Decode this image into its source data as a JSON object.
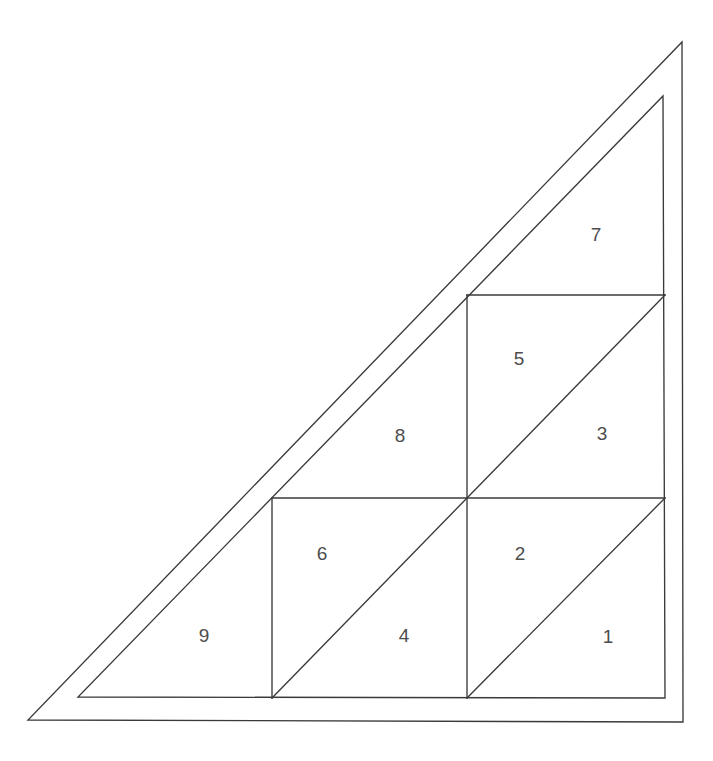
{
  "figure": {
    "type": "geometric-diagram",
    "background_color": "#ffffff",
    "stroke_color": "#3a3a3a",
    "label_color": "#4d4d4d",
    "stroke_width": 1.35
  },
  "outer_triangle": {
    "name": "outer-triangle",
    "vertices": [
      [
        28,
        720
      ],
      [
        683,
        722
      ],
      [
        682,
        42
      ]
    ]
  },
  "inner_triangle": {
    "name": "inner-triangle",
    "vertices": [
      [
        78,
        697
      ],
      [
        665,
        698
      ],
      [
        663,
        96
      ]
    ]
  },
  "grid": {
    "square_size": 198,
    "columns": [
      272,
      467,
      665
    ],
    "rows": [
      295,
      498,
      698
    ],
    "segments": [
      {
        "name": "vertical-left",
        "from": [
          272,
          498
        ],
        "to": [
          272,
          698
        ]
      },
      {
        "name": "vertical-middle",
        "from": [
          467,
          295
        ],
        "to": [
          467,
          698
        ]
      },
      {
        "name": "horizontal-lower",
        "from": [
          272,
          498
        ],
        "to": [
          665,
          498
        ]
      },
      {
        "name": "horizontal-upper",
        "from": [
          467,
          295
        ],
        "to": [
          665,
          295
        ]
      },
      {
        "name": "diagonal-square-1-2",
        "from": [
          467,
          698
        ],
        "to": [
          665,
          498
        ]
      },
      {
        "name": "diagonal-square-4-6",
        "from": [
          272,
          698
        ],
        "to": [
          467,
          498
        ]
      },
      {
        "name": "diagonal-square-3-5",
        "from": [
          467,
          498
        ],
        "to": [
          665,
          295
        ]
      }
    ]
  },
  "regions": [
    {
      "id": "region-1",
      "label": "1",
      "x": 608,
      "y": 638,
      "shape": "triangle",
      "vertices": [
        [
          467,
          698
        ],
        [
          665,
          698
        ],
        [
          665,
          498
        ]
      ]
    },
    {
      "id": "region-2",
      "label": "2",
      "x": 520,
      "y": 555,
      "shape": "triangle",
      "vertices": [
        [
          467,
          698
        ],
        [
          467,
          498
        ],
        [
          665,
          498
        ]
      ]
    },
    {
      "id": "region-3",
      "label": "3",
      "x": 602,
      "y": 435,
      "shape": "triangle",
      "vertices": [
        [
          467,
          498
        ],
        [
          665,
          498
        ],
        [
          665,
          295
        ]
      ]
    },
    {
      "id": "region-4",
      "label": "4",
      "x": 404,
      "y": 637,
      "shape": "triangle",
      "vertices": [
        [
          272,
          698
        ],
        [
          467,
          698
        ],
        [
          467,
          498
        ]
      ]
    },
    {
      "id": "region-5",
      "label": "5",
      "x": 519,
      "y": 360,
      "shape": "triangle",
      "vertices": [
        [
          467,
          498
        ],
        [
          467,
          295
        ],
        [
          665,
          295
        ]
      ]
    },
    {
      "id": "region-6",
      "label": "6",
      "x": 322,
      "y": 555,
      "shape": "triangle",
      "vertices": [
        [
          272,
          698
        ],
        [
          272,
          498
        ],
        [
          467,
          498
        ]
      ]
    },
    {
      "id": "region-7",
      "label": "7",
      "x": 596,
      "y": 236,
      "shape": "triangle",
      "vertices": [
        [
          467,
          295
        ],
        [
          665,
          295
        ],
        [
          663,
          96
        ]
      ]
    },
    {
      "id": "region-8",
      "label": "8",
      "x": 400,
      "y": 437,
      "shape": "triangle",
      "vertices": [
        [
          272,
          498
        ],
        [
          467,
          498
        ],
        [
          467,
          295
        ]
      ]
    },
    {
      "id": "region-9",
      "label": "9",
      "x": 204,
      "y": 637,
      "shape": "triangle",
      "vertices": [
        [
          78,
          697
        ],
        [
          272,
          698
        ],
        [
          272,
          498
        ]
      ]
    }
  ]
}
